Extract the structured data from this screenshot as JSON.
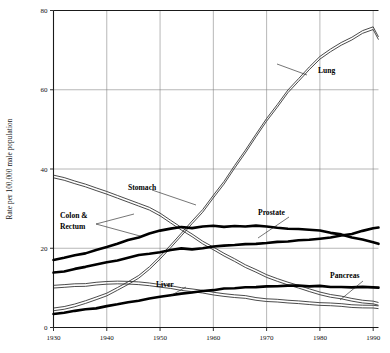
{
  "chart_data": {
    "type": "line",
    "title": "",
    "subtitle": "",
    "xlabel": "",
    "ylabel": "Rate per 100,000 male population",
    "xlim": [
      1930,
      1991
    ],
    "ylim": [
      0,
      80
    ],
    "xticks": [
      1930,
      1940,
      1950,
      1960,
      1970,
      1980,
      1990
    ],
    "yticks": [
      0,
      20,
      40,
      60,
      80
    ],
    "grid": true,
    "legend_position": "inline-annotations",
    "annotations": [
      {
        "label": "Lung",
        "x": 318,
        "y": 73
      },
      {
        "label": "Stomach",
        "x": 128,
        "y": 190
      },
      {
        "label": "Colon &",
        "x": 60,
        "y": 218
      },
      {
        "label": "Rectum",
        "x": 60,
        "y": 229
      },
      {
        "label": "Prostate",
        "x": 258,
        "y": 215
      },
      {
        "label": "Liver",
        "x": 156,
        "y": 287
      },
      {
        "label": "Pancreas",
        "x": 330,
        "y": 278
      }
    ],
    "series": [
      {
        "name": "Lung",
        "style": "thin-double",
        "x": [
          1930,
          1932,
          1934,
          1936,
          1938,
          1940,
          1942,
          1944,
          1946,
          1948,
          1950,
          1952,
          1954,
          1956,
          1958,
          1960,
          1962,
          1964,
          1966,
          1968,
          1970,
          1972,
          1974,
          1976,
          1978,
          1980,
          1982,
          1984,
          1986,
          1988,
          1990,
          1991
        ],
        "values": [
          4.5,
          5.0,
          5.6,
          6.4,
          7.3,
          8.4,
          9.8,
          11.2,
          12.8,
          15.0,
          17.5,
          20.5,
          23.5,
          26.5,
          29.5,
          33.0,
          36.5,
          40.5,
          44.5,
          48.5,
          52.5,
          56.0,
          59.5,
          62.5,
          65.5,
          68.0,
          70.0,
          71.5,
          73.0,
          74.5,
          75.5,
          73.0
        ]
      },
      {
        "name": "Stomach",
        "style": "thin-double",
        "x": [
          1930,
          1932,
          1934,
          1936,
          1938,
          1940,
          1942,
          1944,
          1946,
          1948,
          1950,
          1952,
          1954,
          1956,
          1958,
          1960,
          1962,
          1964,
          1966,
          1968,
          1970,
          1972,
          1974,
          1976,
          1978,
          1980,
          1982,
          1984,
          1986,
          1988,
          1990,
          1991
        ],
        "values": [
          38.0,
          37.4,
          36.6,
          35.8,
          35.0,
          34.0,
          33.0,
          32.0,
          31.0,
          30.0,
          28.5,
          26.8,
          25.0,
          23.2,
          21.5,
          20.0,
          18.5,
          17.0,
          15.6,
          14.3,
          13.0,
          12.0,
          11.0,
          10.2,
          9.4,
          8.7,
          8.0,
          7.5,
          7.0,
          6.6,
          6.2,
          6.0
        ]
      },
      {
        "name": "Colon & Rectum",
        "style": "thick",
        "x": [
          1930,
          1932,
          1934,
          1936,
          1938,
          1940,
          1942,
          1944,
          1946,
          1948,
          1950,
          1952,
          1954,
          1956,
          1958,
          1960,
          1962,
          1964,
          1966,
          1968,
          1970,
          1972,
          1974,
          1976,
          1978,
          1980,
          1982,
          1984,
          1986,
          1988,
          1990,
          1991
        ],
        "values": [
          17.0,
          17.6,
          18.2,
          18.8,
          19.6,
          20.4,
          21.2,
          22.0,
          22.8,
          23.6,
          24.4,
          25.0,
          25.4,
          25.0,
          25.4,
          25.6,
          25.4,
          25.6,
          25.4,
          25.6,
          25.4,
          25.2,
          25.0,
          24.8,
          24.6,
          24.4,
          24.0,
          23.4,
          22.8,
          22.2,
          21.6,
          21.2
        ]
      },
      {
        "name": "Prostate",
        "style": "thick",
        "x": [
          1930,
          1932,
          1934,
          1936,
          1938,
          1940,
          1942,
          1944,
          1946,
          1948,
          1950,
          1952,
          1954,
          1956,
          1958,
          1960,
          1962,
          1964,
          1966,
          1968,
          1970,
          1972,
          1974,
          1976,
          1978,
          1980,
          1982,
          1984,
          1986,
          1988,
          1990,
          1991
        ],
        "values": [
          13.8,
          14.2,
          14.8,
          15.2,
          15.8,
          16.4,
          17.0,
          17.6,
          18.2,
          18.6,
          19.0,
          19.6,
          20.0,
          19.6,
          20.0,
          20.4,
          20.6,
          20.8,
          21.0,
          21.2,
          21.4,
          21.6,
          21.8,
          22.0,
          22.2,
          22.4,
          22.8,
          23.2,
          23.6,
          24.4,
          25.0,
          25.2
        ]
      },
      {
        "name": "Liver",
        "style": "thin-double",
        "x": [
          1930,
          1932,
          1934,
          1936,
          1938,
          1940,
          1942,
          1944,
          1946,
          1948,
          1950,
          1952,
          1954,
          1956,
          1958,
          1960,
          1962,
          1964,
          1966,
          1968,
          1970,
          1972,
          1974,
          1976,
          1978,
          1980,
          1982,
          1984,
          1986,
          1988,
          1990,
          1991
        ],
        "values": [
          10.2,
          10.4,
          10.6,
          10.8,
          11.0,
          11.2,
          11.4,
          11.4,
          11.2,
          11.0,
          10.6,
          10.2,
          9.8,
          9.4,
          9.0,
          8.6,
          8.2,
          7.9,
          7.6,
          7.3,
          7.0,
          6.8,
          6.6,
          6.4,
          6.2,
          6.0,
          5.8,
          5.6,
          5.5,
          5.4,
          5.3,
          5.2
        ]
      },
      {
        "name": "Pancreas",
        "style": "thick",
        "x": [
          1930,
          1932,
          1934,
          1936,
          1938,
          1940,
          1942,
          1944,
          1946,
          1948,
          1950,
          1952,
          1954,
          1956,
          1958,
          1960,
          1962,
          1964,
          1966,
          1968,
          1970,
          1972,
          1974,
          1976,
          1978,
          1980,
          1982,
          1984,
          1986,
          1988,
          1990,
          1991
        ],
        "values": [
          3.5,
          3.8,
          4.1,
          4.5,
          4.9,
          5.3,
          5.8,
          6.3,
          6.8,
          7.3,
          7.8,
          8.2,
          8.6,
          8.9,
          9.2,
          9.5,
          9.8,
          10.0,
          10.2,
          10.3,
          10.4,
          10.5,
          10.5,
          10.5,
          10.4,
          10.4,
          10.3,
          10.3,
          10.2,
          10.2,
          10.1,
          10.1
        ]
      }
    ]
  }
}
